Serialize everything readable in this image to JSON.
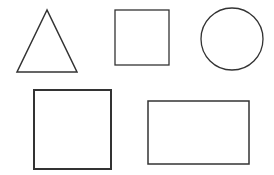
{
  "canvas": {
    "width": 274,
    "height": 175,
    "background": "#ffffff"
  },
  "stroke_color": "#333333",
  "shapes": [
    {
      "id": "triangle",
      "type": "triangle",
      "points": [
        [
          47,
          10
        ],
        [
          17,
          72
        ],
        [
          77,
          72
        ]
      ],
      "stroke_width": 1.5
    },
    {
      "id": "small-square",
      "type": "square",
      "x": 115,
      "y": 10,
      "width": 54,
      "height": 55,
      "stroke_width": 1.3
    },
    {
      "id": "circle",
      "type": "circle",
      "cx": 232,
      "cy": 39,
      "r": 31,
      "stroke_width": 1.3
    },
    {
      "id": "large-square",
      "type": "square",
      "x": 34,
      "y": 90,
      "width": 77,
      "height": 79,
      "stroke_width": 2
    },
    {
      "id": "rectangle",
      "type": "rectangle",
      "x": 148,
      "y": 101,
      "width": 101,
      "height": 63,
      "stroke_width": 1.5
    }
  ]
}
